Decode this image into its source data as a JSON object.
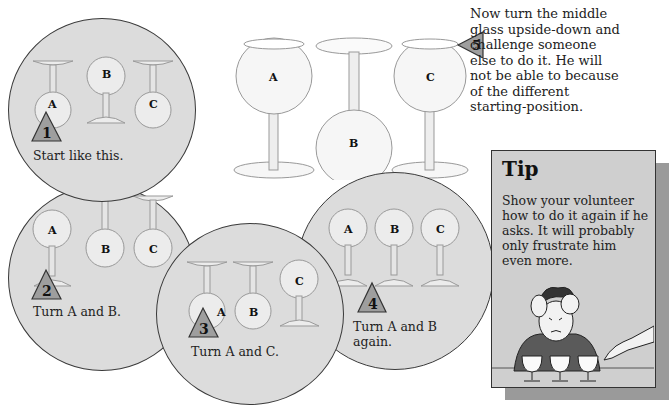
{
  "steps": [
    {
      "number": "1",
      "caption": "Start like this.",
      "glasses": [
        {
          "label": "A",
          "orientation": "upside-down"
        },
        {
          "label": "B",
          "orientation": "upright"
        },
        {
          "label": "C",
          "orientation": "upside-down"
        }
      ]
    },
    {
      "number": "2",
      "caption": "Turn A and B.",
      "glasses": [
        {
          "label": "A",
          "orientation": "upright"
        },
        {
          "label": "B",
          "orientation": "upside-down"
        },
        {
          "label": "C",
          "orientation": "upside-down"
        }
      ]
    },
    {
      "number": "3",
      "caption": "Turn A and C.",
      "glasses": [
        {
          "label": "A",
          "orientation": "upside-down"
        },
        {
          "label": "B",
          "orientation": "upside-down"
        },
        {
          "label": "C",
          "orientation": "upright"
        }
      ]
    },
    {
      "number": "4",
      "caption_line1": "Turn A and B",
      "caption_line2": "again.",
      "glasses": [
        {
          "label": "A",
          "orientation": "upright"
        },
        {
          "label": "B",
          "orientation": "upright"
        },
        {
          "label": "C",
          "orientation": "upright"
        }
      ]
    },
    {
      "number": "5",
      "text": "Now turn the middle glass upside-down and challenge someone else to do it. He will not be able to because of the different starting-position.",
      "glasses": [
        {
          "label": "A",
          "orientation": "upright"
        },
        {
          "label": "B",
          "orientation": "upside-down"
        },
        {
          "label": "C",
          "orientation": "upright"
        }
      ]
    }
  ],
  "step5_lines": [
    "Now turn the middle",
    "glass upside-down and",
    "challenge someone",
    "else to do it. He will",
    "not be able to because",
    "of the different",
    "starting-position."
  ],
  "tip": {
    "title": "Tip",
    "lines": [
      "Show your volunteer",
      "how to do it again if he",
      "asks. It will probably",
      "only frustrate him",
      "even more."
    ]
  },
  "colors": {
    "circle_fill": "#dcdcdc",
    "triangle_fill": "#9e9e9e",
    "tip_fill": "#cfcfcf",
    "tip_shadow": "#9a9a9a",
    "outline": "#333333"
  }
}
